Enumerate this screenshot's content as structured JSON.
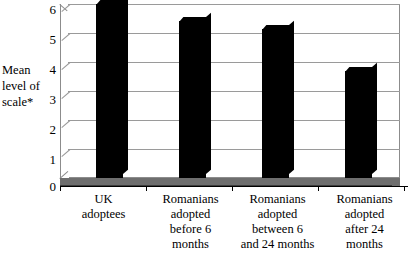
{
  "chart_data": {
    "type": "bar",
    "title": "",
    "subtitle": "",
    "xlabel": "",
    "ylabel": "Mean level of scale*",
    "ylabel_lines": [
      "Mean",
      "level of",
      "scale*"
    ],
    "categories": [
      "UK adoptees",
      "Romanians adopted before 6 months",
      "Romanians adopted between 6 and 24 months",
      "Romanians adopted after 24 months"
    ],
    "category_label_lines": [
      [
        "UK",
        "adoptees"
      ],
      [
        "Romanians",
        "adopted",
        "before 6",
        "months"
      ],
      [
        "Romanians",
        "adopted",
        "between 6",
        "and 24 months"
      ],
      [
        "Romanians",
        "adopted",
        "after 24",
        "months"
      ]
    ],
    "values": [
      6.0,
      5.4,
      5.15,
      3.7
    ],
    "ylim": [
      0,
      6
    ],
    "ytick_labels": [
      "6",
      "5",
      "4",
      "3",
      "2",
      "1",
      "0"
    ],
    "ytick_values": [
      6,
      5,
      4,
      3,
      2,
      1,
      0
    ],
    "grid": true,
    "legend": false,
    "legend_position": "none",
    "style": "3d-column",
    "bar_color": "#000000",
    "grid_color": "#9a9a9a",
    "floor_color": "#6e6e6e",
    "background_color": "#ffffff"
  }
}
